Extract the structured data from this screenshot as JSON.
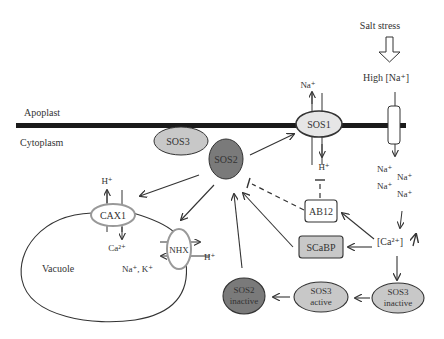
{
  "regions": {
    "apoplast": "Apoplast",
    "cytoplasm": "Cytoplasm",
    "vacuole": "Vacuole"
  },
  "stimulus": {
    "salt_stress": "Salt stress",
    "high_na": "High [Na⁺]"
  },
  "proteins": {
    "sos1": "SOS1",
    "sos2": "SOS2",
    "sos3": "SOS3",
    "cax1": "CAX1",
    "nhx": "NHX",
    "ab12": "AB12",
    "scabp": "SCaBP",
    "sos2_inactive": [
      "SOS2",
      "inactive"
    ],
    "sos3_active": [
      "SOS3",
      "active"
    ],
    "sos3_inactive": [
      "SOS3",
      "inactive"
    ]
  },
  "ions": {
    "sos1_out": "Na⁺",
    "sos1_in": "H⁺",
    "cax1_out": "H⁺",
    "cax1_in": "Ca²⁺",
    "nhx_h": "H⁺",
    "nhx_vac": "Na⁺, K⁺",
    "cyto_na": [
      "Na⁺",
      "Na⁺",
      "Na⁺",
      "Na⁺"
    ],
    "calcium": "[Ca²⁺]"
  },
  "colors": {
    "membrane": "#1a1a1a",
    "light_fill": "#c8c8c8",
    "sos1_fill": "#e6e6e6",
    "dark_fill": "#7a7a7a",
    "stroke": "#333333"
  }
}
